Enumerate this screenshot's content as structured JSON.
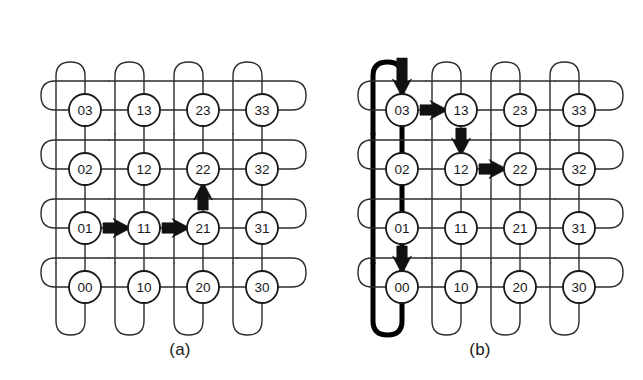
{
  "figure": {
    "panels": [
      {
        "id": "a",
        "caption": "(a)",
        "origin": {
          "x": 28,
          "y": 22
        },
        "topology": "torus-4x4",
        "grid": {
          "cols": 4,
          "rows": 4,
          "spacing": 59,
          "node_radius": 16
        },
        "nodes": [
          {
            "label": "00",
            "col": 0,
            "row": 0
          },
          {
            "label": "10",
            "col": 1,
            "row": 0
          },
          {
            "label": "20",
            "col": 2,
            "row": 0
          },
          {
            "label": "30",
            "col": 3,
            "row": 0
          },
          {
            "label": "01",
            "col": 0,
            "row": 1
          },
          {
            "label": "11",
            "col": 1,
            "row": 1
          },
          {
            "label": "21",
            "col": 2,
            "row": 1
          },
          {
            "label": "31",
            "col": 3,
            "row": 1
          },
          {
            "label": "02",
            "col": 0,
            "row": 2
          },
          {
            "label": "12",
            "col": 1,
            "row": 2
          },
          {
            "label": "22",
            "col": 2,
            "row": 2
          },
          {
            "label": "32",
            "col": 3,
            "row": 2
          },
          {
            "label": "03",
            "col": 0,
            "row": 3
          },
          {
            "label": "13",
            "col": 1,
            "row": 3
          },
          {
            "label": "23",
            "col": 2,
            "row": 3
          },
          {
            "label": "33",
            "col": 3,
            "row": 3
          }
        ],
        "route": {
          "source": "01",
          "destination": "22",
          "path": [
            "01",
            "11",
            "21",
            "22"
          ],
          "arrows": [
            {
              "from": "01",
              "to": "11",
              "direction": "right"
            },
            {
              "from": "11",
              "to": "21",
              "direction": "right"
            },
            {
              "from": "21",
              "to": "22",
              "direction": "up"
            }
          ],
          "wraparound_highlighted": false
        }
      },
      {
        "id": "b",
        "caption": "(b)",
        "origin": {
          "x": 345,
          "y": 22
        },
        "topology": "torus-4x4",
        "grid": {
          "cols": 4,
          "rows": 4,
          "spacing": 59,
          "node_radius": 16
        },
        "nodes": [
          {
            "label": "00",
            "col": 0,
            "row": 0
          },
          {
            "label": "10",
            "col": 1,
            "row": 0
          },
          {
            "label": "20",
            "col": 2,
            "row": 0
          },
          {
            "label": "30",
            "col": 3,
            "row": 0
          },
          {
            "label": "01",
            "col": 0,
            "row": 1
          },
          {
            "label": "11",
            "col": 1,
            "row": 1
          },
          {
            "label": "21",
            "col": 2,
            "row": 1
          },
          {
            "label": "31",
            "col": 3,
            "row": 1
          },
          {
            "label": "02",
            "col": 0,
            "row": 2
          },
          {
            "label": "12",
            "col": 1,
            "row": 2
          },
          {
            "label": "22",
            "col": 2,
            "row": 2
          },
          {
            "label": "32",
            "col": 3,
            "row": 2
          },
          {
            "label": "03",
            "col": 0,
            "row": 3
          },
          {
            "label": "13",
            "col": 1,
            "row": 3
          },
          {
            "label": "23",
            "col": 2,
            "row": 3
          },
          {
            "label": "33",
            "col": 3,
            "row": 3
          }
        ],
        "route": {
          "source": "00",
          "destination": "22",
          "path": [
            "00",
            "03",
            "13",
            "12",
            "22"
          ],
          "arrows": [
            {
              "from": "01",
              "to": "00",
              "direction": "down"
            },
            {
              "from": "wrap-top",
              "to": "03",
              "direction": "down"
            },
            {
              "from": "03",
              "to": "13",
              "direction": "right"
            },
            {
              "from": "13",
              "to": "12",
              "direction": "down"
            },
            {
              "from": "12",
              "to": "22",
              "direction": "right"
            }
          ],
          "wraparound_highlighted": true,
          "wraparound_column": 0
        }
      }
    ],
    "colors": {
      "line": "#2b2b2b",
      "node_stroke": "#1a1a1a",
      "node_fill": "#ffffff",
      "arrow": "#111111",
      "highlight": "#000000",
      "background": "#ffffff",
      "text": "#1a1a1a"
    }
  }
}
